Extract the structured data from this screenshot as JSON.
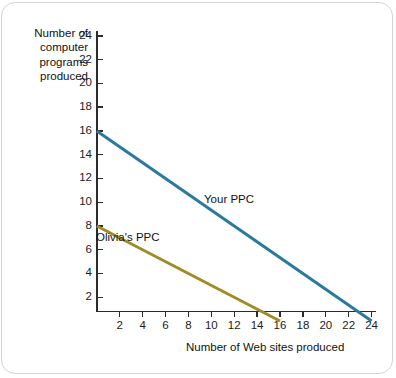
{
  "chart_data": {
    "type": "line",
    "title": "",
    "xlabel": "Number of Web sites produced",
    "ylabel": "Number of computer programs produced",
    "xlim": [
      0,
      25
    ],
    "ylim": [
      0,
      25
    ],
    "grid": false,
    "legend_position": "inline-annotation",
    "xticks": [
      2,
      4,
      6,
      8,
      10,
      12,
      14,
      16,
      18,
      20,
      22,
      24
    ],
    "yticks": [
      2,
      4,
      6,
      8,
      10,
      12,
      14,
      16,
      18,
      20,
      22,
      24
    ],
    "series": [
      {
        "name": "Your PPC",
        "color": "#2b7a9e",
        "x": [
          0,
          24
        ],
        "values": [
          16,
          0
        ]
      },
      {
        "name": "Olivia's PPC",
        "color": "#a08c26",
        "x": [
          0,
          16
        ],
        "values": [
          8,
          0
        ]
      }
    ],
    "annotations": [
      {
        "text": "Your PPC",
        "series": "Your PPC"
      },
      {
        "text": "Olivia's PPC",
        "series": "Olivia's PPC"
      }
    ]
  },
  "axis": {
    "y_title_lines": [
      "Number of",
      "computer",
      "programs",
      "produced"
    ],
    "y_title_text": "Number of computer programs produced",
    "x_title_text": "Number of Web sites produced",
    "y_tick_labels": [
      "24",
      "22",
      "20",
      "18",
      "16",
      "14",
      "12",
      "10",
      "8",
      "6",
      "4",
      "2"
    ],
    "x_tick_labels": [
      "2",
      "4",
      "6",
      "8",
      "10",
      "12",
      "14",
      "16",
      "18",
      "20",
      "22",
      "24"
    ]
  },
  "series_labels": {
    "your_ppc": "Your PPC",
    "olivias_ppc": "Olivia's PPC"
  },
  "colors": {
    "your_ppc_line": "#2b7a9e",
    "olivias_ppc_line": "#a08c26",
    "axis": "#2b2b2b",
    "frame_border": "#d2d4d6",
    "background": "#ffffff",
    "text": "#111111"
  }
}
